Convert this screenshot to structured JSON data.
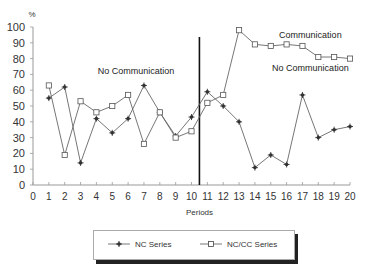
{
  "chart_data": {
    "type": "line",
    "title": "",
    "xlabel": "Periods",
    "ylabel": "%",
    "x": [
      1,
      2,
      3,
      4,
      5,
      6,
      7,
      8,
      9,
      10,
      11,
      12,
      13,
      14,
      15,
      16,
      17,
      18,
      19,
      20
    ],
    "xticks": [
      "0",
      "1",
      "2",
      "3",
      "4",
      "5",
      "6",
      "7",
      "8",
      "9",
      "10",
      "11",
      "12",
      "13",
      "14",
      "15",
      "16",
      "17",
      "18",
      "19",
      "20"
    ],
    "yticks": [
      "0",
      "10",
      "20",
      "30",
      "40",
      "50",
      "60",
      "70",
      "80",
      "90",
      "100"
    ],
    "xlim": [
      0,
      20
    ],
    "ylim": [
      0,
      100
    ],
    "grid": false,
    "legend_position": "bottom",
    "series": [
      {
        "name": "NC Series",
        "marker": "star",
        "values": [
          55,
          62,
          14,
          42,
          33,
          42,
          63,
          46,
          31,
          43,
          59,
          50,
          40,
          11,
          19,
          13,
          57,
          30,
          35,
          37
        ]
      },
      {
        "name": "NC/CC Series",
        "marker": "square",
        "values": [
          63,
          19,
          53,
          46,
          50,
          57,
          26,
          46,
          30,
          34,
          52,
          57,
          98,
          89,
          88,
          89,
          88,
          81,
          81,
          80
        ]
      }
    ],
    "annotations": [
      {
        "text": "No Communication",
        "x": 6.5,
        "y": 70
      },
      {
        "text": "Communication",
        "x": 17.5,
        "y": 93
      },
      {
        "text": "No Communication",
        "x": 17.5,
        "y": 72
      }
    ],
    "divider_x": 10.5
  },
  "legend": {
    "nc": "NC Series",
    "nccc": "NC/CC Series"
  }
}
